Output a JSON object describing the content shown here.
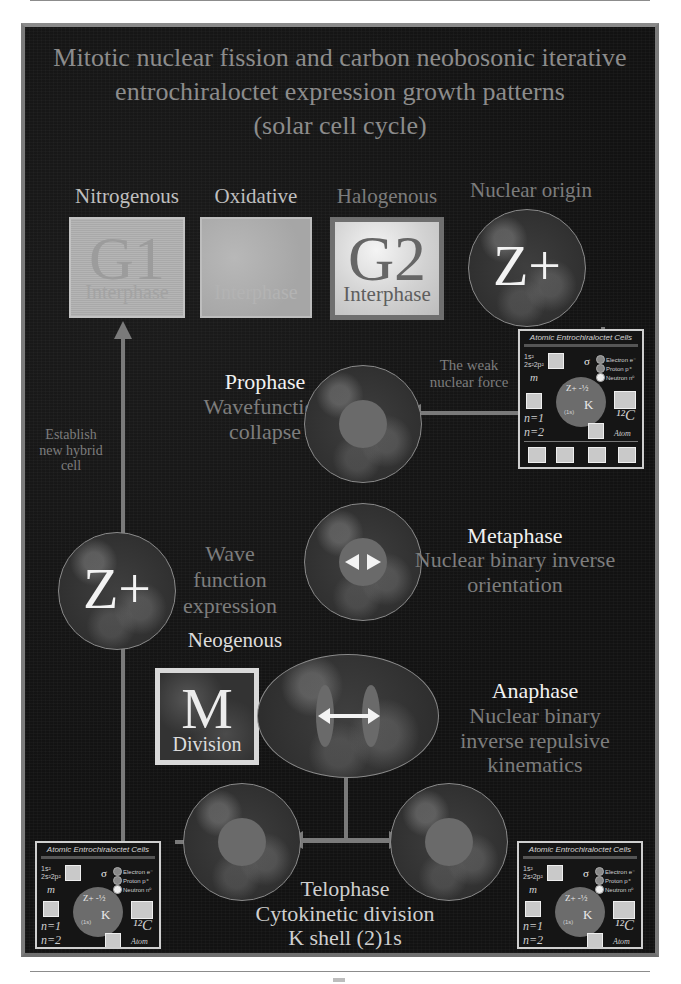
{
  "title": {
    "line1": "Mitotic nuclear fission and carbon neobosonic iterative",
    "line2": "entrochiraloctet expression growth patterns",
    "line3": "(solar cell cycle)"
  },
  "top_row": {
    "nitrogenous": {
      "header": "Nitrogenous",
      "letter": "G1",
      "sub": "Interphase"
    },
    "oxidative": {
      "header": "Oxidative",
      "letter": "",
      "sub": "Interphase"
    },
    "halogenous": {
      "header": "Halogenous",
      "letter": "G2",
      "sub": "Interphase"
    },
    "nuclear_origin": {
      "header": "Nuclear origin",
      "symbol": "Z+"
    }
  },
  "weak_force_label": {
    "line1": "The weak",
    "line2": "nuclear force"
  },
  "establish_label": {
    "line1": "Establish",
    "line2": "new hybrid",
    "line3": "cell"
  },
  "prophase": {
    "name": "Prophase",
    "line1": "Wavefunction",
    "line2": "collapse"
  },
  "metaphase": {
    "name": "Metaphase",
    "line1": "Nuclear binary inverse",
    "line2": "orientation",
    "arrow": "⟷"
  },
  "wave_function": {
    "symbol": "Z+",
    "line1": "Wave",
    "line2": "function",
    "line3": "expression"
  },
  "neogenous": {
    "header": "Neogenous",
    "letter": "M",
    "sub": "Division"
  },
  "anaphase": {
    "name": "Anaphase",
    "line1": "Nuclear binary",
    "line2": "inverse repulsive",
    "line3": "kinematics"
  },
  "telophase": {
    "name": "Telophase",
    "line1": "Cytokinetic division",
    "line2": "K shell  (2)1s"
  },
  "inset": {
    "title": "Atomic Entrochiraloctet Cells",
    "config_1": "1s²",
    "config_2": "2s²2p²",
    "m_label": "m",
    "sigma": "σ",
    "zplus": "Z+ -½",
    "plus_half": "+½",
    "k_label": "K",
    "one_s": "(1s)",
    "l_label": "L",
    "n1": "n=1",
    "n2": "n=2",
    "pi1": "π₁",
    "pi2": "π₂",
    "carbon": "¹²C",
    "atom": "Atom",
    "legend": [
      "Electron e⁻",
      "Proton p⁺",
      "Neutron n⁰"
    ]
  },
  "colors": {
    "panel_bg": "#121212",
    "panel_border": "#7b7b7b",
    "title_text": "#8c8c8c",
    "phase_name": "#f1f1f1",
    "phase_desc": "#7d7d7d",
    "arrow": "#7a7a7a",
    "core": "#6a6a6a"
  }
}
